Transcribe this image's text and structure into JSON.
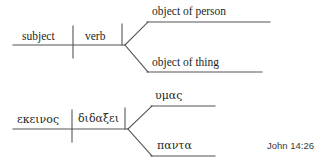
{
  "page": {
    "background": "#ffffff",
    "ink": "#231f20",
    "line_color": "#555555"
  },
  "diagrams": [
    {
      "id": "schematic",
      "type": "sentence-diagram",
      "language": "english-schematic",
      "slots": [
        {
          "name": "subject",
          "label": "subject"
        },
        {
          "name": "verb",
          "label": "verb"
        },
        {
          "name": "object-of-person",
          "label": "object of person"
        },
        {
          "name": "object-of-thing",
          "label": "object of thing"
        }
      ],
      "geometry": {
        "baseline": {
          "x1": 13,
          "y1": 45,
          "x2": 125,
          "y2": 45
        },
        "subject_verb_divider": {
          "x": 73,
          "y1": 26,
          "y2": 58
        },
        "verb_object_divider": {
          "x": 122,
          "y1": 24,
          "y2": 45
        },
        "fork_apex": {
          "x": 125,
          "y": 45
        },
        "upper_branch": {
          "x1": 125,
          "y1": 45,
          "x2": 148,
          "y2": 22
        },
        "upper_line": {
          "x1": 148,
          "y1": 22,
          "x2": 270,
          "y2": 22
        },
        "lower_branch": {
          "x1": 125,
          "y1": 45,
          "x2": 148,
          "y2": 72
        },
        "lower_line": {
          "x1": 148,
          "y1": 72,
          "x2": 262,
          "y2": 72
        }
      }
    },
    {
      "id": "greek-example",
      "type": "sentence-diagram",
      "language": "koine-greek",
      "slots": [
        {
          "name": "subject",
          "label": "εκεινος"
        },
        {
          "name": "verb",
          "label": "διδαξει"
        },
        {
          "name": "object-of-person",
          "label": "υμας"
        },
        {
          "name": "object-of-thing",
          "label": "παντα"
        }
      ],
      "geometry": {
        "baseline": {
          "x1": 13,
          "y1": 129,
          "x2": 128,
          "y2": 129
        },
        "subject_verb_divider": {
          "x": 72,
          "y1": 110,
          "y2": 142
        },
        "verb_object_divider": {
          "x": 125,
          "y1": 108,
          "y2": 129
        },
        "fork_apex": {
          "x": 128,
          "y": 129
        },
        "upper_branch": {
          "x1": 128,
          "y1": 129,
          "x2": 152,
          "y2": 106
        },
        "upper_line": {
          "x1": 152,
          "y1": 106,
          "x2": 215,
          "y2": 106
        },
        "lower_branch": {
          "x1": 128,
          "y1": 129,
          "x2": 152,
          "y2": 156
        },
        "lower_line": {
          "x1": 152,
          "y1": 156,
          "x2": 215,
          "y2": 156
        }
      }
    }
  ],
  "citation": {
    "text": "John 14:26"
  }
}
